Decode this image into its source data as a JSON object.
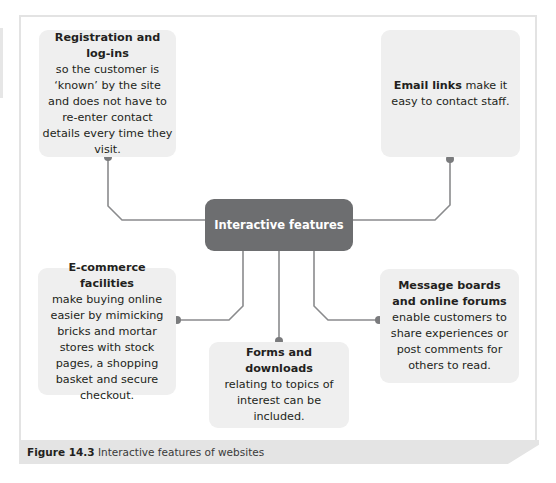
{
  "figure": {
    "caption_label": "Figure 14.3",
    "caption_text": " Interactive features of websites"
  },
  "center": {
    "label": "Interactive features"
  },
  "boxes": {
    "registration": {
      "title": "Registration and log-ins",
      "body": "so the customer is ‘known’ by the site and does not have to re-enter contact details every time they visit."
    },
    "email": {
      "title": "Email links",
      "body": " make it easy to contact staff."
    },
    "ecommerce": {
      "title": "E-commerce facilities",
      "body": "make buying online easier by mimicking bricks and mortar stores with stock pages, a shopping basket and secure checkout."
    },
    "forms": {
      "title": "Forms and downloads",
      "body": "relating to topics of interest can be included."
    },
    "forums": {
      "title": "Message boards and online forums",
      "body": " enable customers to share experiences or post comments for others to read."
    }
  },
  "colors": {
    "box_fill": "#efefef",
    "center_fill": "#6d6e70",
    "line": "#8a8b8d",
    "dot": "#7a7b7d",
    "caption_bar": "#e4e4e4"
  }
}
